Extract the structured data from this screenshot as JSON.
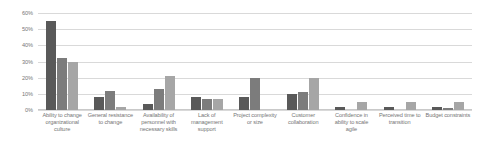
{
  "chart_data": {
    "type": "bar",
    "title": "",
    "subtitle": "",
    "xlabel": "",
    "ylabel": "",
    "ylim": [
      0,
      60
    ],
    "y_tick_labels": [
      "60%",
      "50%",
      "40%",
      "30%",
      "20%",
      "10%",
      "0%"
    ],
    "y_tick_values": [
      60,
      50,
      40,
      30,
      20,
      10,
      0
    ],
    "grid": true,
    "legend": "none",
    "categories": [
      "Ability to change organizational culture",
      "General resistance to change",
      "Availability of personnel with necessary skills",
      "Lack of management support",
      "Project complexity or size",
      "Customer collaboration",
      "Confidence in ability to scale agile",
      "Perceived time to transition",
      "Budget constraints"
    ],
    "series": [
      {
        "name": "Series 1",
        "color": "#595959",
        "values": [
          55,
          8,
          4,
          8,
          8,
          10,
          2,
          2,
          2
        ]
      },
      {
        "name": "Series 2",
        "color": "#7c7c7c",
        "values": [
          32,
          12,
          13,
          7,
          20,
          11,
          0,
          0,
          1.5
        ]
      },
      {
        "name": "Series 3",
        "color": "#a6a6a6",
        "values": [
          30,
          2,
          21,
          7,
          0,
          20,
          5,
          5,
          5
        ]
      }
    ]
  }
}
